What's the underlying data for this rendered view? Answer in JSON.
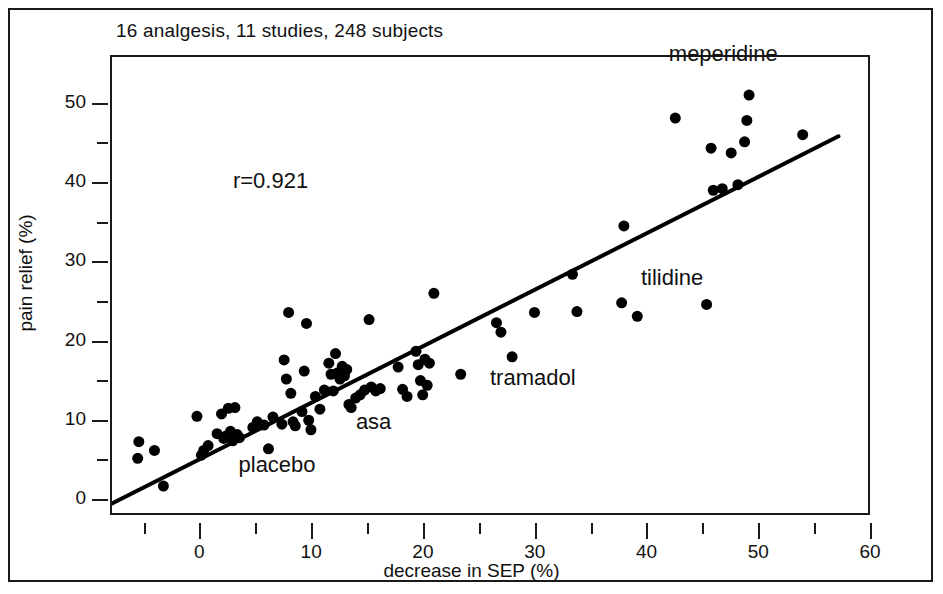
{
  "figure": {
    "title": "16 analgesis, 11 studies, 248 subjects",
    "r_label": "r=0.921"
  },
  "annotations": [
    {
      "text": "meperidine",
      "x": 42.0,
      "y": 56.0
    },
    {
      "text": "tilidine",
      "x": 39.5,
      "y": 27.8
    },
    {
      "text": "tramadol",
      "x": 26.0,
      "y": 15.2
    },
    {
      "text": "asa",
      "x": 14.0,
      "y": 9.6
    },
    {
      "text": "placebo",
      "x": 3.5,
      "y": 4.2
    }
  ],
  "chart_data": {
    "type": "scatter",
    "title": "16 analgesis, 11 studies, 248 subjects",
    "xlabel": "decrease in SEP (%)",
    "ylabel": "pain relief (%)",
    "xlim": [
      -8,
      60
    ],
    "ylim": [
      -2,
      56
    ],
    "grid": false,
    "legend": "none",
    "correlation": 0.921,
    "correlation_label": "r=0.921",
    "x_major_ticks": [
      0,
      10,
      20,
      30,
      40,
      50,
      60
    ],
    "x_minor_ticks": [
      -5,
      5,
      15,
      25,
      35,
      45,
      55
    ],
    "y_major_ticks": [
      0,
      10,
      20,
      30,
      40,
      50
    ],
    "y_minor_ticks": [
      5,
      15,
      25,
      35,
      45
    ],
    "marker": {
      "shape": "circle",
      "color": "#000000",
      "size_px": 11
    },
    "fit_line": {
      "type": "linear",
      "color": "#000000",
      "width_px": 4,
      "x_start": -8.0,
      "y_start": -0.3,
      "x_end": 57.0,
      "y_end": 46.0,
      "slope": 0.712,
      "intercept": 5.4
    },
    "series": [
      {
        "name": "analgesic studies",
        "points": [
          [
            -5.6,
            7.5
          ],
          [
            -5.7,
            5.4
          ],
          [
            -4.2,
            6.4
          ],
          [
            -3.4,
            1.9
          ],
          [
            -0.4,
            10.7
          ],
          [
            0.2,
            6.4
          ],
          [
            0.0,
            5.8
          ],
          [
            0.6,
            7.0
          ],
          [
            1.4,
            8.5
          ],
          [
            1.8,
            11.0
          ],
          [
            2.0,
            7.9
          ],
          [
            2.2,
            8.2
          ],
          [
            2.4,
            11.7
          ],
          [
            2.6,
            8.8
          ],
          [
            2.8,
            7.6
          ],
          [
            3.0,
            11.8
          ],
          [
            3.2,
            8.4
          ],
          [
            3.4,
            8.0
          ],
          [
            4.6,
            9.3
          ],
          [
            5.0,
            10.0
          ],
          [
            5.6,
            9.6
          ],
          [
            6.0,
            6.6
          ],
          [
            6.4,
            10.6
          ],
          [
            7.2,
            9.7
          ],
          [
            7.4,
            17.8
          ],
          [
            7.6,
            15.4
          ],
          [
            7.8,
            23.8
          ],
          [
            8.0,
            13.6
          ],
          [
            8.2,
            10.0
          ],
          [
            8.4,
            9.5
          ],
          [
            9.0,
            11.3
          ],
          [
            9.2,
            16.4
          ],
          [
            9.4,
            22.4
          ],
          [
            9.6,
            10.2
          ],
          [
            9.8,
            9.0
          ],
          [
            10.2,
            13.2
          ],
          [
            10.6,
            11.6
          ],
          [
            11.0,
            14.0
          ],
          [
            11.4,
            17.4
          ],
          [
            11.6,
            16.0
          ],
          [
            11.8,
            13.9
          ],
          [
            12.0,
            18.6
          ],
          [
            12.2,
            16.2
          ],
          [
            12.4,
            15.4
          ],
          [
            12.6,
            17.0
          ],
          [
            12.8,
            15.8
          ],
          [
            13.0,
            16.6
          ],
          [
            13.2,
            12.2
          ],
          [
            13.4,
            11.8
          ],
          [
            13.8,
            13.0
          ],
          [
            14.2,
            13.4
          ],
          [
            14.6,
            14.0
          ],
          [
            15.0,
            22.9
          ],
          [
            15.2,
            14.4
          ],
          [
            15.6,
            13.9
          ],
          [
            16.0,
            14.2
          ],
          [
            17.6,
            16.9
          ],
          [
            18.0,
            14.1
          ],
          [
            18.4,
            13.2
          ],
          [
            19.2,
            18.9
          ],
          [
            19.4,
            17.2
          ],
          [
            19.6,
            15.2
          ],
          [
            19.8,
            13.4
          ],
          [
            20.0,
            17.9
          ],
          [
            20.2,
            14.6
          ],
          [
            20.4,
            17.4
          ],
          [
            20.8,
            26.2
          ],
          [
            23.2,
            16.0
          ],
          [
            26.4,
            22.5
          ],
          [
            26.8,
            21.3
          ],
          [
            27.8,
            18.2
          ],
          [
            29.8,
            23.8
          ],
          [
            33.2,
            28.6
          ],
          [
            33.6,
            23.9
          ],
          [
            37.6,
            25.0
          ],
          [
            37.8,
            34.7
          ],
          [
            39.0,
            23.3
          ],
          [
            42.4,
            48.3
          ],
          [
            45.2,
            24.8
          ],
          [
            45.6,
            44.5
          ],
          [
            45.8,
            39.2
          ],
          [
            46.6,
            39.4
          ],
          [
            47.4,
            43.9
          ],
          [
            48.0,
            39.9
          ],
          [
            48.6,
            45.3
          ],
          [
            48.8,
            48.0
          ],
          [
            49.0,
            51.2
          ],
          [
            53.8,
            46.2
          ]
        ]
      }
    ]
  }
}
